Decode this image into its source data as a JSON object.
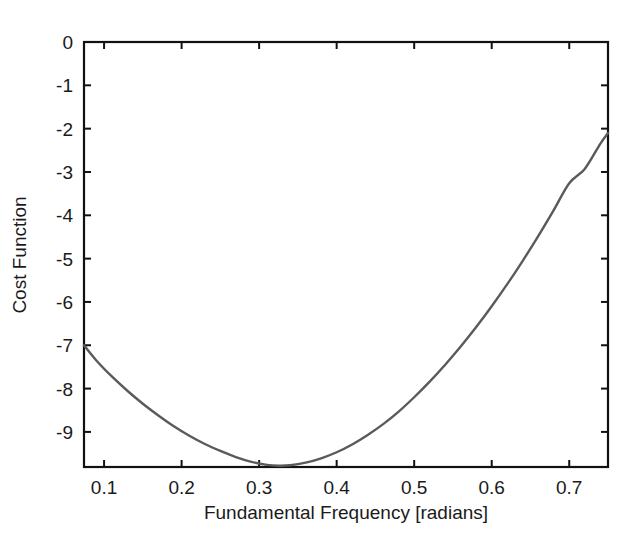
{
  "chart_data": {
    "type": "line",
    "title": "",
    "subtitle": "",
    "xlabel": "Fundamental Frequency [radians]",
    "ylabel": "Cost Function",
    "xlim": [
      0.0741,
      0.75
    ],
    "ylim": [
      -9.81,
      0.0
    ],
    "xticks": [
      0.1,
      0.2,
      0.3,
      0.4,
      0.5,
      0.6,
      0.7
    ],
    "xtick_labels": [
      "0.1",
      "0.2",
      "0.3",
      "0.4",
      "0.5",
      "0.6",
      "0.7"
    ],
    "yticks": [
      0,
      -1,
      -2,
      -3,
      -4,
      -5,
      -6,
      -7,
      -8,
      -9
    ],
    "ytick_labels": [
      "0",
      "-1",
      "-2",
      "-3",
      "-4",
      "-5",
      "-6",
      "-7",
      "-8",
      "-9"
    ],
    "grid": false,
    "legend": false,
    "legend_position": "none",
    "box": true,
    "series": [
      {
        "name": "Cost Function",
        "color": "#5a5a5a",
        "line_width": 2.4,
        "x": [
          0.0741,
          0.09,
          0.11,
          0.13,
          0.15,
          0.17,
          0.19,
          0.21,
          0.23,
          0.25,
          0.27,
          0.29,
          0.31,
          0.325,
          0.34,
          0.36,
          0.38,
          0.4,
          0.42,
          0.44,
          0.46,
          0.48,
          0.5,
          0.52,
          0.54,
          0.56,
          0.58,
          0.6,
          0.62,
          0.64,
          0.66,
          0.68,
          0.7,
          0.72,
          0.74,
          0.75
        ],
        "y": [
          -7.0,
          -7.35,
          -7.72,
          -8.05,
          -8.35,
          -8.62,
          -8.87,
          -9.09,
          -9.28,
          -9.44,
          -9.58,
          -9.69,
          -9.76,
          -9.78,
          -9.77,
          -9.71,
          -9.61,
          -9.47,
          -9.29,
          -9.07,
          -8.82,
          -8.53,
          -8.2,
          -7.84,
          -7.45,
          -7.03,
          -6.58,
          -6.1,
          -5.59,
          -5.05,
          -4.48,
          -3.88,
          -3.26,
          -2.93,
          -2.35,
          -2.1
        ]
      }
    ],
    "annotations": []
  },
  "axes": {
    "x_axis_title": "Fundamental Frequency [radians]",
    "y_axis_title": "Cost Function"
  }
}
